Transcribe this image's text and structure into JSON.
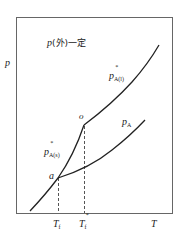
{
  "diagram": {
    "title_p": "p",
    "title_rest": "(外)一定",
    "y_axis_label": "p",
    "x_axis_label": "T",
    "curves": {
      "liquid_vapor": {
        "label_main": "p",
        "label_star": "*",
        "label_sub": "A(l)"
      },
      "solid_vapor": {
        "label_main": "p",
        "label_star": "*",
        "label_sub": "A(s)"
      },
      "solution": {
        "label_main": "p",
        "label_sub": "A"
      }
    },
    "points": {
      "a": "a",
      "o": "o"
    },
    "x_ticks": {
      "tf": {
        "main": "T",
        "sub": "f"
      },
      "tf_star": {
        "main": "T",
        "sub": "f",
        "star": "*"
      }
    },
    "colors": {
      "line": "#222222",
      "frame": "#555555",
      "dash": "#555555"
    }
  }
}
